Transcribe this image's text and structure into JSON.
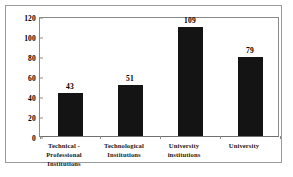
{
  "chart_data": {
    "type": "bar",
    "title": "",
    "subtitle": "",
    "xlabel": "",
    "ylabel": "",
    "categories": [
      "Technical - Professional Institutions",
      "Technological Institutions",
      "University institutions",
      "University"
    ],
    "category_lines": [
      [
        "Technical -",
        "Professional",
        "Institutions"
      ],
      [
        "Technological",
        "Institutions"
      ],
      [
        "University",
        "institutions"
      ],
      [
        "University"
      ]
    ],
    "values": [
      43,
      51,
      109,
      79
    ],
    "value_labels": [
      "43",
      "51",
      "109",
      "79"
    ],
    "ylim": [
      0,
      120
    ],
    "yticks": [
      0,
      20,
      40,
      60,
      80,
      100,
      120
    ],
    "ytick_labels": [
      "0",
      "20",
      "40",
      "60",
      "80",
      "100",
      "120"
    ],
    "grid": false,
    "legend": null,
    "legend_position": "none",
    "bar_color": "#141414",
    "plot_background": "#ffffff",
    "axis_color": "#8a8a8a",
    "frame_color": "#9a9a9a",
    "text_color": "#000000"
  }
}
